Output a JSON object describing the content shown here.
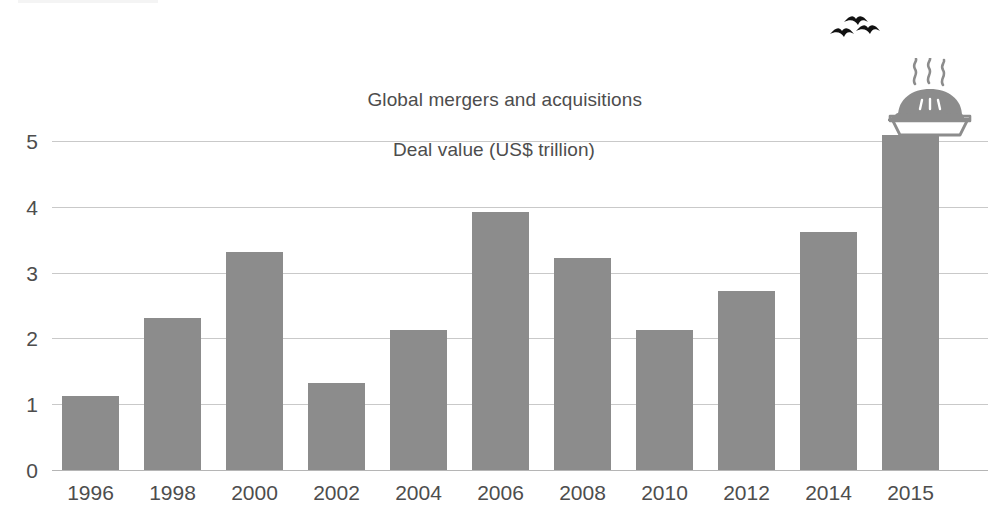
{
  "chart_data": {
    "type": "bar",
    "title": "Global mergers and acquisitions",
    "subtitle": "Deal value (US$ trillion)",
    "xlabel": "",
    "ylabel": "",
    "categories": [
      "1996",
      "1998",
      "2000",
      "2002",
      "2004",
      "2006",
      "2008",
      "2010",
      "2012",
      "2014",
      "2015"
    ],
    "values": [
      1.12,
      2.31,
      3.32,
      1.33,
      2.13,
      3.92,
      3.22,
      2.13,
      2.72,
      3.62,
      5.09
    ],
    "ylim": [
      0,
      5.4
    ],
    "yticks": [
      0,
      1,
      2,
      3,
      4,
      5
    ],
    "ytick_labels": [
      "0",
      "1",
      "2",
      "3",
      "4",
      "5"
    ],
    "grid": true,
    "legend": null,
    "series": [
      {
        "name": "Deal value (US$ trillion)",
        "values": [
          1.12,
          2.31,
          3.32,
          1.33,
          2.13,
          3.92,
          3.22,
          2.13,
          2.72,
          3.62,
          5.09
        ]
      }
    ],
    "colors": {
      "bar": "#8c8c8c",
      "gridline": "#c9c9c9",
      "text": "#4d4d4d",
      "background": "#ffffff",
      "birds": "#111111",
      "pie": "#8c8c8c"
    },
    "annotations": [
      {
        "name": "pie-illustration",
        "description": "steaming pie",
        "at_category": "2015"
      },
      {
        "name": "birds-illustration",
        "description": "three flying birds",
        "at_category": "2015"
      }
    ]
  }
}
